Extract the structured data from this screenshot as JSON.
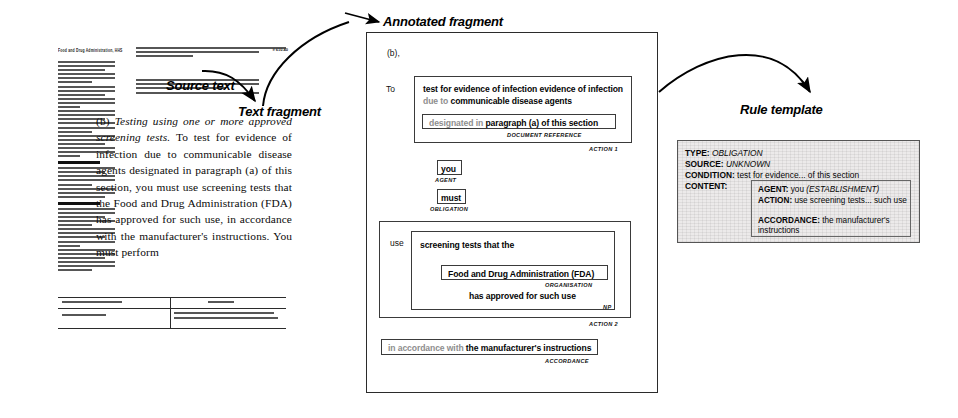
{
  "labels": {
    "source_text": "Source text",
    "text_fragment": "Text fragment",
    "annotated_fragment": "Annotated fragment",
    "rule_template": "Rule template"
  },
  "source_document": {
    "header": "Food and Drug Administration, HHS",
    "folio": "§ 610.40",
    "excerpt_marker": "(b)",
    "excerpt_italic_lead": "Testing using one or more approved screening tests.",
    "excerpt_body": " To test for evidence of infection due to communicable disease agents designated in paragraph (a) of this section, you must use screening tests that the Food and Drug Administration (FDA) has approved for such use, in accordance with the manufacturer's instructions. You must perform"
  },
  "annotated_fragment": {
    "paragraph_marker": "(b),",
    "to_label": "To",
    "action1": {
      "phrase_bold_1": "test for evidence of infection evidence of infection",
      "phrase_faint": " due to ",
      "phrase_bold_2": "communicable disease agents",
      "document_reference": {
        "faint": "designated in ",
        "bold": "paragraph (a) of this section",
        "tag": "DOCUMENT REFERENCE"
      },
      "tag": "ACTION 1"
    },
    "agent": {
      "text": "you",
      "tag": "AGENT"
    },
    "obligation": {
      "text": "must",
      "tag": "OBLIGATION"
    },
    "action2": {
      "verb": "use",
      "np_line1": "screening tests that the",
      "organisation": {
        "text": "Food and Drug Administration (FDA)",
        "tag": "ORGANISATION"
      },
      "np_line2": "has approved for such use",
      "np_tag": "NP",
      "tag": "ACTION 2"
    },
    "accordance": {
      "faint": "in accordance with ",
      "bold": "the manufacturer's instructions",
      "tag": "ACCORDANCE"
    }
  },
  "rule_template": {
    "type_key": "TYPE:",
    "type_value": "OBLIGATION",
    "source_key": "SOURCE:",
    "source_value": "UNKNOWN",
    "condition_key": "CONDITION:",
    "condition_value": "test for evidence... of this section",
    "content_key": "CONTENT:",
    "content": {
      "agent_key": "AGENT:",
      "agent_value": "you",
      "agent_type": "(ESTABLISHMENT)",
      "action_key": "ACTION:",
      "action_value": "use screening tests... such use",
      "accordance_key": "ACCORDANCE:",
      "accordance_value": "the manufacturer's instructions"
    }
  }
}
